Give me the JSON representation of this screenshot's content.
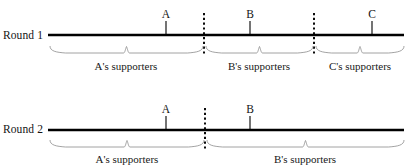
{
  "figure": {
    "type": "number-line-diagram",
    "background_color": "#ffffff",
    "axis_color": "#000000",
    "brace_color": "#8c8c8c",
    "dashed_color": "#000000",
    "text_color": "#141414"
  },
  "rounds": [
    {
      "id": "round-1",
      "label": "Round 1",
      "label_x": 3,
      "label_y": 29,
      "line": {
        "x1": 48,
        "x2": 404,
        "y": 35,
        "thickness": 2.6
      },
      "candidates": [
        {
          "name": "A",
          "x": 166,
          "label_y": 8,
          "tick_top": 21,
          "tick_bottom": 35
        },
        {
          "name": "B",
          "x": 250,
          "label_y": 8,
          "tick_top": 21,
          "tick_bottom": 35
        },
        {
          "name": "C",
          "x": 372,
          "label_y": 8,
          "tick_top": 21,
          "tick_bottom": 35
        }
      ],
      "dividers": [
        {
          "x": 204,
          "y1": 13,
          "y2": 56
        },
        {
          "x": 314,
          "y1": 13,
          "y2": 56
        }
      ],
      "groups": [
        {
          "label": "A's supporters",
          "x1": 50,
          "x2": 203,
          "center_x": 126,
          "brace_y": 46,
          "text_y": 60
        },
        {
          "label": "B's supporters",
          "x1": 206,
          "x2": 313,
          "center_x": 259,
          "brace_y": 46,
          "text_y": 60
        },
        {
          "label": "C's supporters",
          "x1": 316,
          "x2": 404,
          "center_x": 360,
          "brace_y": 46,
          "text_y": 60
        }
      ]
    },
    {
      "id": "round-2",
      "label": "Round 2",
      "label_x": 3,
      "label_y": 123,
      "line": {
        "x1": 48,
        "x2": 404,
        "y": 130,
        "thickness": 2.6
      },
      "candidates": [
        {
          "name": "A",
          "x": 166,
          "label_y": 103,
          "tick_top": 116,
          "tick_bottom": 130
        },
        {
          "name": "B",
          "x": 250,
          "label_y": 103,
          "tick_top": 116,
          "tick_bottom": 130
        }
      ],
      "dividers": [
        {
          "x": 205,
          "y1": 108,
          "y2": 150
        }
      ],
      "groups": [
        {
          "label": "A's supporters",
          "x1": 50,
          "x2": 204,
          "center_x": 127,
          "brace_y": 140,
          "text_y": 153
        },
        {
          "label": "B's supporters",
          "x1": 207,
          "x2": 404,
          "center_x": 305,
          "brace_y": 140,
          "text_y": 153
        }
      ]
    }
  ]
}
